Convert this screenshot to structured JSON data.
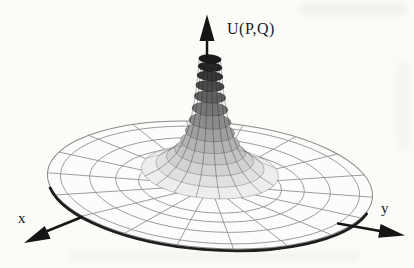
{
  "diagram": {
    "type": "3d_surface_of_revolution_polar_mesh",
    "labels": {
      "vertical_axis": "U(P,Q)",
      "x_axis": "x",
      "y_axis": "y"
    },
    "geometry": {
      "center_x": 210,
      "center_y": 185,
      "disk_rx": 163,
      "disk_ry": 63,
      "tilt_deg": 4.3,
      "amplitude": 9.5,
      "flat_ring_fractions": [
        0.44,
        0.58,
        0.74,
        0.92
      ],
      "spoke_count": 18,
      "spoke_inner_fraction": 0.21,
      "rim_arc_deg": [
        168,
        14
      ],
      "funnel_bands": [
        {
          "z": 13,
          "fill": "#ededed"
        },
        {
          "z": 19,
          "fill": "#e0e0e0"
        },
        {
          "z": 26,
          "fill": "#d2d2d2"
        },
        {
          "z": 34,
          "fill": "#c4c4c4"
        },
        {
          "z": 43,
          "fill": "#b3b3b3"
        },
        {
          "z": 53,
          "fill": "#a0a0a0"
        },
        {
          "z": 64,
          "fill": "#8c8c8c"
        },
        {
          "z": 76,
          "fill": "#767676"
        },
        {
          "z": 88,
          "fill": "#606060"
        },
        {
          "z": 99,
          "fill": "#4a4a4a"
        },
        {
          "z": 109,
          "fill": "#373737"
        },
        {
          "z": 118,
          "fill": "#262626"
        },
        {
          "z": 126,
          "fill": "#1a1a1a"
        }
      ]
    },
    "colors": {
      "background": "#fbfbf8",
      "disk_fill": "#fcfcfa",
      "mesh_line": "#949494",
      "disk_outline": "#8a8a8a",
      "rim": "#1e1e1e",
      "arrow": "#151515",
      "band_ring_line": "rgba(0,0,0,0.30)",
      "surface_spoke_line": "rgba(25,25,25,0.38)",
      "label_text": "#1c1c1c"
    },
    "arrows": {
      "u": {
        "shaft": [
          [
            207,
            56
          ],
          [
            207,
            40
          ]
        ],
        "head": [
          [
            207,
            14.5
          ],
          [
            199.5,
            41
          ],
          [
            214.5,
            41
          ]
        ]
      },
      "x": {
        "shaft": [
          [
            82,
            217
          ],
          [
            46,
            231.5
          ]
        ],
        "head": [
          [
            24,
            243
          ],
          [
            44.8,
            226.0
          ],
          [
            50.6,
            238.8
          ]
        ]
      },
      "y": {
        "shaft": [
          [
            338,
            223.5
          ],
          [
            380,
            231
          ]
        ],
        "head": [
          [
            405,
            235.5
          ],
          [
            378.2,
            237.8
          ],
          [
            380.6,
            224.0
          ]
        ]
      }
    }
  }
}
